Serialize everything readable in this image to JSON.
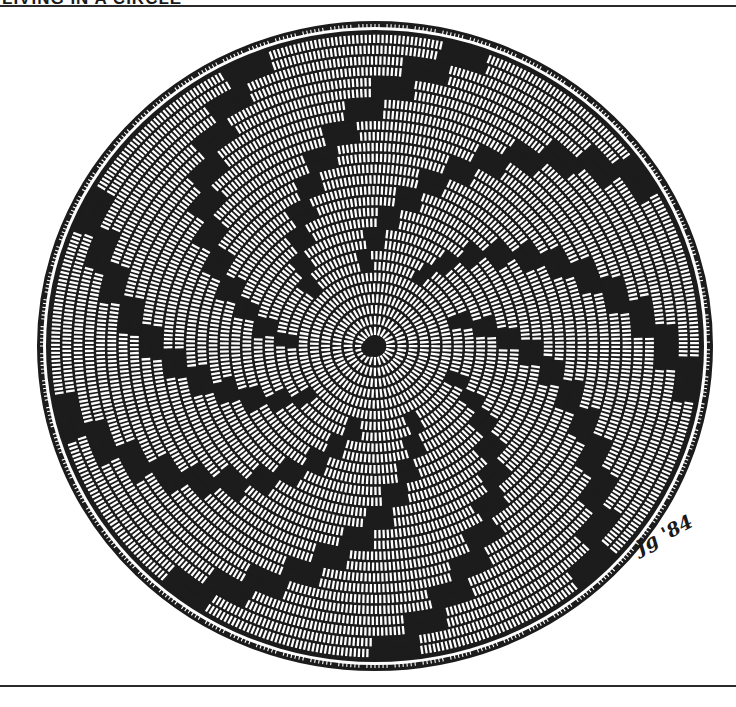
{
  "header": {
    "title": "LIVING IN A CIRCLE"
  },
  "illustration": {
    "subject": "coiled basket viewed from above",
    "center": [
      375,
      346
    ],
    "radius_x": 337,
    "radius_y": 324,
    "ring_count": 28,
    "spiral_arm_count": 9,
    "ink_color": "#1c1c1c",
    "paper_color": "#ffffff"
  },
  "signature": {
    "text": "Jg '84"
  }
}
